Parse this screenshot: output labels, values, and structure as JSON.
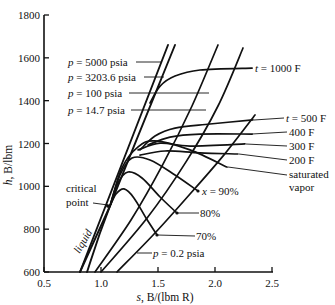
{
  "chart_data": {
    "type": "line",
    "title": "",
    "xlabel": "s, B/(lbm R)",
    "ylabel": "h, B/lbm",
    "axis_labels": {
      "x_var": "s",
      "x_rest": ", B/(lbm R)",
      "y_var": "h",
      "y_rest": ", B/lbm"
    },
    "xlim": [
      0.5,
      2.5
    ],
    "ylim": [
      600,
      1800
    ],
    "xticks": [
      0.5,
      1.0,
      1.5,
      2.0,
      2.5
    ],
    "xtick_labels": [
      "0.5",
      "1.0",
      "1.5",
      "2.0",
      "2.5"
    ],
    "yticks": [
      600,
      800,
      1000,
      1200,
      1400,
      1600,
      1800
    ],
    "ytick_labels": [
      "600",
      "800",
      "1000",
      "1200",
      "1400",
      "1600",
      "1800"
    ],
    "grid": false,
    "legend": null,
    "critical_point": [
      1.06,
      908
    ],
    "series": [
      {
        "name": "p = 5000 psia",
        "kind": "pressure",
        "heavy": true,
        "points": [
          [
            0.816,
            600
          ],
          [
            1.588,
            1660
          ]
        ]
      },
      {
        "name": "p = 3203.6 psia",
        "kind": "pressure",
        "heavy": true,
        "points": [
          [
            0.877,
            600
          ],
          [
            1.079,
            908
          ],
          [
            1.649,
            1660
          ]
        ]
      },
      {
        "name": "saturated liquid",
        "kind": "saturation",
        "heavy": true,
        "points": [
          [
            0.816,
            600
          ],
          [
            1.079,
            908
          ]
        ]
      },
      {
        "name": "p = 100 psia",
        "kind": "pressure",
        "points": [
          [
            0.947,
            600
          ],
          [
            1.263,
            843
          ],
          [
            1.544,
            1104
          ],
          [
            1.798,
            1375
          ],
          [
            2.026,
            1660
          ]
        ]
      },
      {
        "name": "p = 14.7 psia",
        "kind": "pressure",
        "points": [
          [
            1.0,
            600
          ],
          [
            1.404,
            852
          ],
          [
            1.746,
            1114
          ],
          [
            2.026,
            1375
          ],
          [
            2.246,
            1646
          ]
        ]
      },
      {
        "name": "p = 0.2 psia",
        "kind": "pressure",
        "points": [
          [
            1.14,
            600
          ],
          [
            1.474,
            782
          ],
          [
            1.781,
            964
          ],
          [
            2.077,
            1146
          ],
          [
            2.351,
            1333
          ]
        ]
      },
      {
        "name": "saturated vapor",
        "kind": "saturation",
        "points": [
          [
            1.079,
            908
          ],
          [
            1.184,
            1086
          ],
          [
            1.325,
            1184
          ],
          [
            1.474,
            1212
          ],
          [
            1.781,
            1170
          ],
          [
            2.105,
            1090
          ]
        ]
      },
      {
        "name": "x = 90%",
        "kind": "quality",
        "points": [
          [
            1.079,
            908
          ],
          [
            1.167,
            1053
          ],
          [
            1.272,
            1132
          ],
          [
            1.43,
            1123
          ],
          [
            1.649,
            1053
          ],
          [
            1.851,
            978
          ]
        ]
      },
      {
        "name": "x = 80%",
        "kind": "quality",
        "points": [
          [
            1.079,
            908
          ],
          [
            1.149,
            1016
          ],
          [
            1.237,
            1067
          ],
          [
            1.36,
            1039
          ],
          [
            1.518,
            950
          ],
          [
            1.667,
            875
          ]
        ]
      },
      {
        "name": "x = 70%",
        "kind": "quality",
        "points": [
          [
            1.079,
            908
          ],
          [
            1.132,
            964
          ],
          [
            1.202,
            988
          ],
          [
            1.289,
            946
          ],
          [
            1.395,
            852
          ],
          [
            1.491,
            773
          ]
        ]
      },
      {
        "name": "t = 200 F",
        "kind": "temperature",
        "points": [
          [
            1.342,
            1146
          ],
          [
            1.561,
            1165
          ],
          [
            1.868,
            1156
          ],
          [
            2.202,
            1151
          ]
        ]
      },
      {
        "name": "t = 300 F",
        "kind": "temperature",
        "points": [
          [
            1.325,
            1170
          ],
          [
            1.518,
            1202
          ],
          [
            1.781,
            1188
          ],
          [
            2.263,
            1198
          ]
        ]
      },
      {
        "name": "t = 400 F",
        "kind": "temperature",
        "points": [
          [
            1.412,
            1193
          ],
          [
            1.605,
            1230
          ],
          [
            1.868,
            1244
          ],
          [
            2.325,
            1244
          ]
        ]
      },
      {
        "name": "t = 500 F",
        "kind": "temperature",
        "points": [
          [
            1.342,
            1170
          ],
          [
            1.474,
            1235
          ],
          [
            1.649,
            1272
          ],
          [
            1.956,
            1291
          ],
          [
            2.333,
            1310
          ]
        ]
      },
      {
        "name": "t = 1000 F",
        "kind": "temperature",
        "points": [
          [
            1.43,
            1389
          ],
          [
            1.518,
            1468
          ],
          [
            1.649,
            1515
          ],
          [
            1.868,
            1543
          ],
          [
            2.325,
            1552
          ]
        ]
      }
    ],
    "annotations": {
      "p5000": {
        "var": "p",
        "rest": " = 5000 psia"
      },
      "p3203": {
        "var": "p",
        "rest": " = 3203.6 psia"
      },
      "p100": {
        "var": "p",
        "rest": " = 100 psia"
      },
      "p14": {
        "var": "p",
        "rest": " = 14.7 psia"
      },
      "p02": {
        "var": "p",
        "rest": " = 0.2 psia"
      },
      "t1000": {
        "var": "t",
        "rest": " = 1000 F"
      },
      "t500": {
        "var": "t",
        "rest": " = 500 F"
      },
      "t400": "400 F",
      "t300": "300 F",
      "t200": "200 F",
      "sat_vapor_line1": "saturated",
      "sat_vapor_line2": "vapor",
      "x90": {
        "var": "x",
        "rest": " = 90%"
      },
      "x80": "80%",
      "x70": "70%",
      "critical_line1": "critical",
      "critical_line2": "point",
      "liquid": "liquid"
    }
  }
}
